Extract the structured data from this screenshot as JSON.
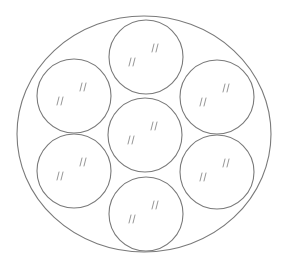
{
  "diagram": {
    "stroke_color": "#7a7a7a",
    "background": "#ffffff",
    "outer": {
      "shape": "ellipse",
      "cx": 144,
      "cy": 134,
      "rx": 127,
      "ry": 118
    },
    "circles": [
      {
        "id": "top",
        "cx": 146,
        "cy": 57,
        "r": 37
      },
      {
        "id": "upper-left",
        "cx": 74,
        "cy": 96,
        "r": 37
      },
      {
        "id": "upper-right",
        "cx": 217,
        "cy": 97,
        "r": 37
      },
      {
        "id": "center",
        "cx": 145,
        "cy": 135,
        "r": 37
      },
      {
        "id": "lower-left",
        "cx": 74,
        "cy": 171,
        "r": 37
      },
      {
        "id": "lower-right",
        "cx": 217,
        "cy": 172,
        "r": 37
      },
      {
        "id": "bottom",
        "cx": 146,
        "cy": 214,
        "r": 37
      }
    ],
    "glare_marks": "pairs of short slanted strokes ('//') inside each circle indicating a glossy surface"
  }
}
